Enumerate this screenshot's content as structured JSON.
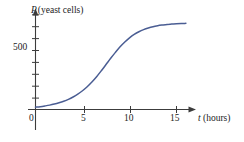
{
  "chart_data": {
    "type": "line",
    "title": "",
    "subtitle": "",
    "xlabel_var": "t",
    "xlabel_unit": "(hours)",
    "ylabel_var": "P",
    "ylabel_unit": "(yeast cells)",
    "xlim": [
      0,
      16
    ],
    "ylim": [
      0,
      800
    ],
    "grid": false,
    "legend": "none",
    "xticks": [
      0,
      5,
      10,
      15
    ],
    "xtick_labels": [
      "0",
      "5",
      "10",
      "15"
    ],
    "yticks": [
      100,
      200,
      300,
      400,
      500,
      600,
      700,
      800
    ],
    "ytick_labels": [
      "",
      "",
      "",
      "",
      "500",
      "",
      "",
      ""
    ],
    "ylabeled_tick_value": 500,
    "ylabeled_tick_text": "500",
    "series": [
      {
        "name": "yeast population",
        "color": "#4a5d93",
        "x": [
          0.0,
          0.5,
          1.0,
          1.5,
          2.0,
          2.5,
          3.0,
          3.5,
          4.0,
          4.5,
          5.0,
          5.5,
          6.0,
          6.5,
          7.0,
          7.5,
          8.0,
          8.5,
          9.0,
          9.5,
          10.0,
          10.5,
          11.0,
          11.5,
          12.0,
          12.5,
          13.0,
          13.5,
          14.0,
          14.5,
          15.0,
          15.5,
          16.0
        ],
        "y": [
          20,
          24,
          30,
          37,
          46,
          57,
          70,
          86,
          106,
          130,
          159,
          193,
          233,
          278,
          328,
          381,
          434,
          484,
          531,
          572,
          607,
          636,
          659,
          677,
          691,
          702,
          710,
          716,
          721,
          724,
          727,
          729,
          730
        ]
      }
    ]
  },
  "labels": {
    "y_axis_label_var": "P",
    "y_axis_label_unit": "(yeast cells)",
    "x_axis_label_var": "t",
    "x_axis_label_unit": "(hours)",
    "y_500": "500",
    "x_0": "0",
    "x_5": "5",
    "x_10": "10",
    "x_15": "15"
  },
  "colors": {
    "curve": "#4a5d93",
    "axis": "#3c3c3c",
    "text": "#1b1b1b",
    "background": "#ffffff"
  }
}
